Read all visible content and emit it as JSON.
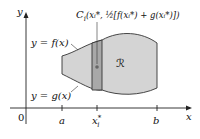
{
  "diagram": {
    "axes": {
      "x_label": "x",
      "y_label": "y",
      "origin_label": "0"
    },
    "ticks": {
      "a": "a",
      "xi": "x",
      "xi_sup": "*",
      "xi_sub": "i",
      "b": "b"
    },
    "curves": {
      "upper": "y = f(x)",
      "lower": "y = g(x)"
    },
    "region_label": "ℛ",
    "centroid_label": "C",
    "centroid_sub": "i",
    "centroid_coords": "(xᵢ*, ½[f(xᵢ*) + g(xᵢ*)])",
    "colors": {
      "region_fill": "#d4d4d4",
      "strip_fill": "#a8a8a8",
      "stroke": "#333333",
      "dot": "#666666"
    }
  }
}
